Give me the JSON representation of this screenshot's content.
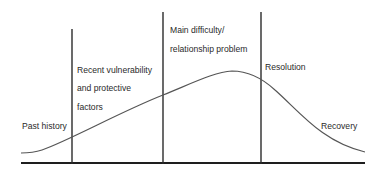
{
  "diagram": {
    "type": "phase-timeline-curve",
    "labels": {
      "past_history": "Past history",
      "recent_vulnerability_line1": "Recent vulnerability",
      "recent_vulnerability_line2": "and protective",
      "recent_vulnerability_line3": "factors",
      "main_difficulty_line1": "Main difficulty/",
      "main_difficulty_line2": "relationship problem",
      "resolution": "Resolution",
      "recovery": "Recovery"
    },
    "phases": [
      "Past history",
      "Recent vulnerability and protective factors",
      "Main difficulty/relationship problem",
      "Resolution",
      "Recovery"
    ],
    "colors": {
      "line": "#1e1e1e",
      "curve": "#555555",
      "text": "#2a2a2a",
      "background": "#ffffff"
    }
  }
}
